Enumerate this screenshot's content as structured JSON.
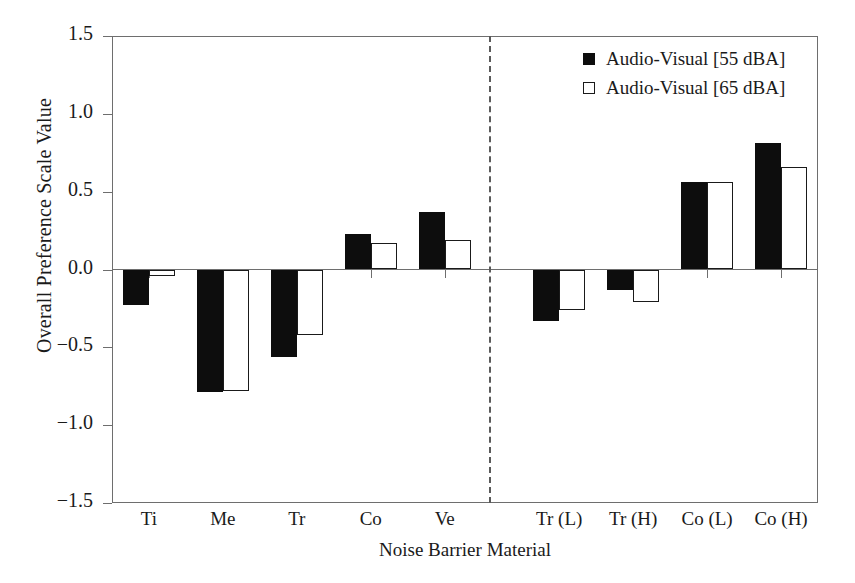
{
  "chart_data": {
    "type": "bar",
    "title": "",
    "xlabel": "Noise Barrier Material",
    "ylabel": "Overall Preference Scale Value",
    "ylim": [
      -1.5,
      1.5
    ],
    "yticks": [
      "1.5",
      "1.0",
      "0.5",
      "0.0",
      "-0.5",
      "-1.0",
      "-1.5"
    ],
    "ytick_values": [
      1.5,
      1.0,
      0.5,
      0.0,
      -0.5,
      -1.0,
      -1.5
    ],
    "grid": false,
    "legend_position": "top-right",
    "categories": [
      "Ti",
      "Me",
      "Tr",
      "Co",
      "Ve",
      "Tr (L)",
      "Tr (H)",
      "Co (L)",
      "Co (H)"
    ],
    "series": [
      {
        "name": "Audio-Visual [55 dBA]",
        "style": "filled",
        "color": "#0d0d0d",
        "values": [
          -0.23,
          -0.79,
          -0.56,
          0.23,
          0.37,
          -0.33,
          -0.13,
          0.56,
          0.81
        ]
      },
      {
        "name": "Audio-Visual [65 dBA]",
        "style": "open",
        "color": "#ffffff",
        "values": [
          -0.04,
          -0.78,
          -0.42,
          0.17,
          0.19,
          -0.26,
          -0.21,
          0.56,
          0.66
        ]
      }
    ],
    "annotations": [
      {
        "type": "vertical-dashed-divider",
        "after_category": "Ve"
      }
    ]
  },
  "legend": {
    "items": [
      {
        "label": "Audio-Visual [55 dBA]",
        "style": "filled"
      },
      {
        "label": "Audio-Visual [65 dBA]",
        "style": "open"
      }
    ]
  }
}
